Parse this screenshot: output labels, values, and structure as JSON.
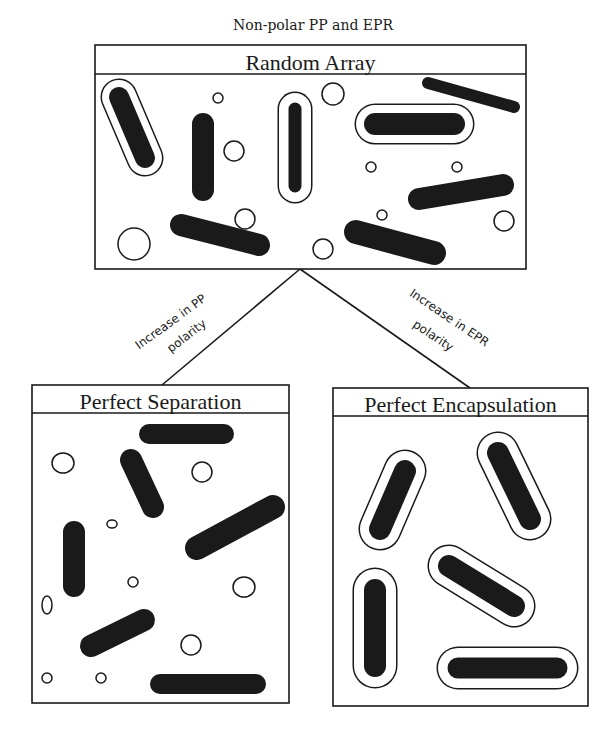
{
  "figure": {
    "title": "Non-polar PP and EPR",
    "colors": {
      "ink": "#1a1a1a",
      "background": "#ffffff"
    }
  },
  "panels": {
    "random": {
      "label": "Random Array",
      "frame": {
        "x": 95,
        "y": 45,
        "w": 431,
        "h": 224,
        "header_h": 29
      },
      "rods": [
        {
          "x1": 192,
          "y1": 124,
          "x2": 192,
          "y2": 124,
          "dummy": true
        }
      ],
      "capsules": [
        {
          "x1": 119,
          "y1": 97,
          "x2": 145,
          "y2": 158,
          "core_w": 20,
          "shell_w": 34
        },
        {
          "x1": 295,
          "y1": 109,
          "x2": 295,
          "y2": 186,
          "core_w": 13,
          "shell_w": 32
        },
        {
          "x1": 375,
          "y1": 124,
          "x2": 454,
          "y2": 124,
          "core_w": 22,
          "shell_w": 38
        }
      ],
      "solid_rods": [
        {
          "x1": 203,
          "y1": 124,
          "x2": 203,
          "y2": 190,
          "w": 22
        },
        {
          "x1": 181,
          "y1": 225,
          "x2": 259,
          "y2": 245,
          "w": 22
        },
        {
          "x1": 428,
          "y1": 83,
          "x2": 514,
          "y2": 107,
          "w": 12
        },
        {
          "x1": 419,
          "y1": 199,
          "x2": 503,
          "y2": 185,
          "w": 22
        },
        {
          "x1": 356,
          "y1": 232,
          "x2": 434,
          "y2": 253,
          "w": 24
        }
      ],
      "particles": [
        {
          "cx": 218,
          "cy": 98,
          "rx": 5,
          "ry": 5
        },
        {
          "cx": 234,
          "cy": 151,
          "rx": 10,
          "ry": 10
        },
        {
          "cx": 245,
          "cy": 219,
          "rx": 10,
          "ry": 10
        },
        {
          "cx": 134,
          "cy": 244,
          "rx": 16,
          "ry": 16
        },
        {
          "cx": 333,
          "cy": 94,
          "rx": 11,
          "ry": 11
        },
        {
          "cx": 371,
          "cy": 167,
          "rx": 5,
          "ry": 5
        },
        {
          "cx": 457,
          "cy": 167,
          "rx": 5,
          "ry": 5
        },
        {
          "cx": 382,
          "cy": 215,
          "rx": 5,
          "ry": 5
        },
        {
          "cx": 504,
          "cy": 221,
          "rx": 10,
          "ry": 10
        },
        {
          "cx": 323,
          "cy": 249,
          "rx": 10,
          "ry": 10
        }
      ]
    },
    "separation": {
      "label": "Perfect Separation",
      "frame": {
        "x": 32,
        "y": 385,
        "w": 257,
        "h": 318,
        "header_h": 28
      },
      "capsules": [],
      "solid_rods": [
        {
          "x1": 149,
          "y1": 434,
          "x2": 224,
          "y2": 434,
          "w": 20
        },
        {
          "x1": 131,
          "y1": 460,
          "x2": 153,
          "y2": 507,
          "w": 22
        },
        {
          "x1": 197,
          "y1": 548,
          "x2": 273,
          "y2": 507,
          "w": 24
        },
        {
          "x1": 74,
          "y1": 532,
          "x2": 74,
          "y2": 586,
          "w": 22
        },
        {
          "x1": 91,
          "y1": 646,
          "x2": 144,
          "y2": 620,
          "w": 22
        },
        {
          "x1": 160,
          "y1": 684,
          "x2": 256,
          "y2": 684,
          "w": 20
        }
      ],
      "particles": [
        {
          "cx": 63,
          "cy": 463,
          "rx": 11,
          "ry": 10
        },
        {
          "cx": 202,
          "cy": 472,
          "rx": 10,
          "ry": 10
        },
        {
          "cx": 112,
          "cy": 524,
          "rx": 5,
          "ry": 4
        },
        {
          "cx": 133,
          "cy": 582,
          "rx": 5,
          "ry": 5
        },
        {
          "cx": 244,
          "cy": 587,
          "rx": 11,
          "ry": 10
        },
        {
          "cx": 47,
          "cy": 605,
          "rx": 5,
          "ry": 9
        },
        {
          "cx": 191,
          "cy": 645,
          "rx": 10,
          "ry": 10
        },
        {
          "cx": 47,
          "cy": 678,
          "rx": 5,
          "ry": 5
        },
        {
          "cx": 101,
          "cy": 678,
          "rx": 5,
          "ry": 5
        }
      ]
    },
    "encapsulation": {
      "label": "Perfect Encapsulation",
      "frame": {
        "x": 333,
        "y": 388,
        "w": 255,
        "h": 318,
        "header_h": 28
      },
      "capsules": [
        {
          "x1": 405,
          "y1": 471,
          "x2": 380,
          "y2": 529,
          "core_w": 22,
          "shell_w": 40
        },
        {
          "x1": 498,
          "y1": 453,
          "x2": 530,
          "y2": 519,
          "core_w": 22,
          "shell_w": 40
        },
        {
          "x1": 449,
          "y1": 566,
          "x2": 514,
          "y2": 606,
          "core_w": 22,
          "shell_w": 40
        },
        {
          "x1": 375,
          "y1": 590,
          "x2": 375,
          "y2": 666,
          "core_w": 22,
          "shell_w": 42
        },
        {
          "x1": 458,
          "y1": 668,
          "x2": 557,
          "y2": 668,
          "core_w": 21,
          "shell_w": 40
        }
      ],
      "solid_rods": [],
      "particles": []
    }
  },
  "transitions": [
    {
      "line1": "Increase in PP",
      "line2": "polarity",
      "from": [
        300,
        269
      ],
      "to": [
        162,
        385
      ],
      "l1": {
        "cx": 173,
        "cy": 325,
        "angle": -36
      },
      "l2": {
        "cx": 189,
        "cy": 339,
        "angle": -38
      }
    },
    {
      "line1": "Increase in EPR",
      "line2": "polarity",
      "from": [
        300,
        269
      ],
      "to": [
        470,
        388
      ],
      "l1": {
        "cx": 447,
        "cy": 321,
        "angle": 34
      },
      "l2": {
        "cx": 431,
        "cy": 339,
        "angle": 34
      }
    }
  ]
}
